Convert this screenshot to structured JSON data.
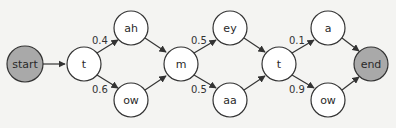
{
  "diagram": {
    "type": "pronunciation-network",
    "colors": {
      "background": "#f4f4f2",
      "node_fill": "#ffffff",
      "terminal_fill": "#a9a9a9",
      "stroke": "#333333"
    },
    "nodes": [
      {
        "id": "start",
        "label": "start",
        "terminal": true
      },
      {
        "id": "t1",
        "label": "t"
      },
      {
        "id": "ah",
        "label": "ah"
      },
      {
        "id": "ow1",
        "label": "ow"
      },
      {
        "id": "m",
        "label": "m"
      },
      {
        "id": "ey",
        "label": "ey"
      },
      {
        "id": "aa",
        "label": "aa"
      },
      {
        "id": "t2",
        "label": "t"
      },
      {
        "id": "a",
        "label": "a"
      },
      {
        "id": "ow2",
        "label": "ow"
      },
      {
        "id": "end",
        "label": "end",
        "terminal": true
      }
    ],
    "edges": [
      {
        "from": "start",
        "to": "t1",
        "prob": ""
      },
      {
        "from": "t1",
        "to": "ah",
        "prob": "0.4"
      },
      {
        "from": "t1",
        "to": "ow1",
        "prob": "0.6"
      },
      {
        "from": "ah",
        "to": "m",
        "prob": ""
      },
      {
        "from": "ow1",
        "to": "m",
        "prob": ""
      },
      {
        "from": "m",
        "to": "ey",
        "prob": "0.5"
      },
      {
        "from": "m",
        "to": "aa",
        "prob": "0.5"
      },
      {
        "from": "ey",
        "to": "t2",
        "prob": ""
      },
      {
        "from": "aa",
        "to": "t2",
        "prob": ""
      },
      {
        "from": "t2",
        "to": "a",
        "prob": "0.1"
      },
      {
        "from": "t2",
        "to": "ow2",
        "prob": "0.9"
      },
      {
        "from": "a",
        "to": "end",
        "prob": ""
      },
      {
        "from": "ow2",
        "to": "end",
        "prob": ""
      }
    ],
    "labels": {
      "start": "start",
      "t1": "t",
      "ah": "ah",
      "ow1": "ow",
      "m": "m",
      "ey": "ey",
      "aa": "aa",
      "t2": "t",
      "a": "a",
      "ow2": "ow",
      "end": "end",
      "p_t1_ah": "0.4",
      "p_t1_ow1": "0.6",
      "p_m_ey": "0.5",
      "p_m_aa": "0.5",
      "p_t2_a": "0.1",
      "p_t2_ow2": "0.9"
    }
  }
}
